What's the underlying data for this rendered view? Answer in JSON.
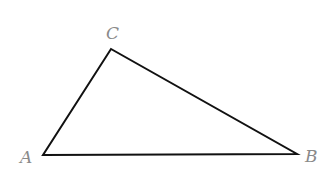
{
  "diagram": {
    "type": "triangle",
    "stroke_color": "#111111",
    "label_color": "#8a8a8a",
    "vertices": [
      {
        "name": "A",
        "x": 43,
        "y": 155,
        "label_x": 20,
        "label_y": 163
      },
      {
        "name": "B",
        "x": 297,
        "y": 154,
        "label_x": 305,
        "label_y": 162
      },
      {
        "name": "C",
        "x": 111,
        "y": 49,
        "label_x": 106,
        "label_y": 39
      }
    ]
  }
}
